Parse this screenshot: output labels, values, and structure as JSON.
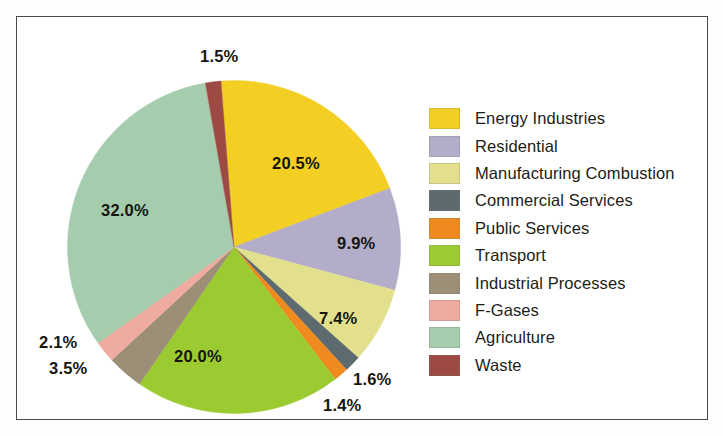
{
  "figure": {
    "background_color": "#fefefc",
    "border_color": "#4a4a50",
    "plot_background": "#ffffff"
  },
  "chart_data": {
    "type": "pie",
    "title": "",
    "subtitle": "",
    "xlabel": "",
    "ylabel": "",
    "legend_position": "right",
    "grid": false,
    "start_angle_deg": -4.5,
    "direction": "clockwise",
    "units": "percent",
    "categories": [
      "Energy Industries",
      "Residential",
      "Manufacturing Combustion",
      "Commercial Services",
      "Public Services",
      "Transport",
      "Industrial Processes",
      "F-Gases",
      "Agriculture",
      "Waste"
    ],
    "values": [
      20.5,
      9.9,
      7.4,
      1.6,
      1.4,
      20.0,
      3.5,
      2.1,
      32.0,
      1.5
    ],
    "data_labels": [
      "20.5%",
      "9.9%",
      "7.4%",
      "1.6%",
      "1.4%",
      "20.0%",
      "3.5%",
      "2.1%",
      "32.0%",
      "1.5%"
    ],
    "colors": [
      "#f2cf22",
      "#b4adc9",
      "#e2e08c",
      "#5d6b71",
      "#ef8b1e",
      "#9ccb31",
      "#9d8f77",
      "#efaba0",
      "#a5ccac",
      "#9e4a44"
    ],
    "total": 99.9
  },
  "legend": {
    "items": [
      {
        "label": "Energy Industries",
        "color": "#f2cf22"
      },
      {
        "label": "Residential",
        "color": "#b4adc9"
      },
      {
        "label": "Manufacturing Combustion",
        "color": "#e2e08c"
      },
      {
        "label": "Commercial Services",
        "color": "#5d6b71"
      },
      {
        "label": "Public Services",
        "color": "#ef8b1e"
      },
      {
        "label": "Transport",
        "color": "#9ccb31"
      },
      {
        "label": "Industrial Processes",
        "color": "#9d8f77"
      },
      {
        "label": "F-Gases",
        "color": "#efaba0"
      },
      {
        "label": "Agriculture",
        "color": "#a5ccac"
      },
      {
        "label": "Waste",
        "color": "#9e4a44"
      }
    ]
  },
  "slice_labels": [
    {
      "text": "1.5%",
      "left": 183,
      "top": 30
    },
    {
      "text": "20.5%",
      "left": 255,
      "top": 137
    },
    {
      "text": "9.9%",
      "left": 320,
      "top": 217
    },
    {
      "text": "7.4%",
      "left": 302,
      "top": 292
    },
    {
      "text": "1.6%",
      "left": 336,
      "top": 353
    },
    {
      "text": "1.4%",
      "left": 306,
      "top": 379
    },
    {
      "text": "20.0%",
      "left": 157,
      "top": 330
    },
    {
      "text": "3.5%",
      "left": 32,
      "top": 342
    },
    {
      "text": "2.1%",
      "left": 22,
      "top": 316
    },
    {
      "text": "32.0%",
      "left": 84,
      "top": 184
    }
  ]
}
